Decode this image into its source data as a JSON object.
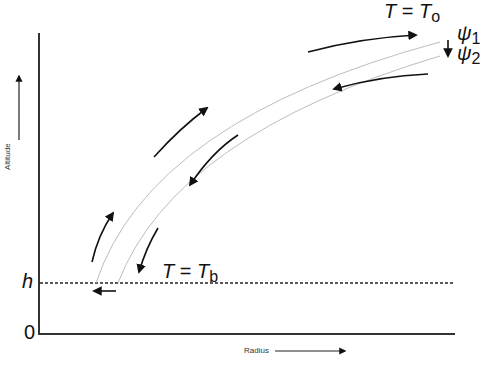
{
  "diagram": {
    "axes": {
      "y_label": "Altitude",
      "x_label": "Radius",
      "y_ticks": [
        {
          "label": "h",
          "italic": true
        },
        {
          "label": "0",
          "italic": false
        }
      ]
    },
    "labels": {
      "top_temperature": {
        "lhs": "T",
        "eq": " = ",
        "rhs": "T",
        "sub": "o"
      },
      "bottom_temperature": {
        "lhs": "T",
        "eq": " = ",
        "rhs": "T",
        "sub": "b"
      },
      "streamline_1": {
        "symbol": "ψ",
        "sub": "1"
      },
      "streamline_2": {
        "symbol": "ψ",
        "sub": "2"
      }
    },
    "streamlines": [
      {
        "name": "psi-1",
        "color": "#bdbdbd"
      },
      {
        "name": "psi-2",
        "color": "#bdbdbd"
      }
    ],
    "boundary": {
      "name": "h-level",
      "style": "dashed",
      "color": "#222222"
    },
    "colors": {
      "axis": "#333333",
      "arrow": "#111111",
      "streamline": "#bdbdbd"
    }
  }
}
